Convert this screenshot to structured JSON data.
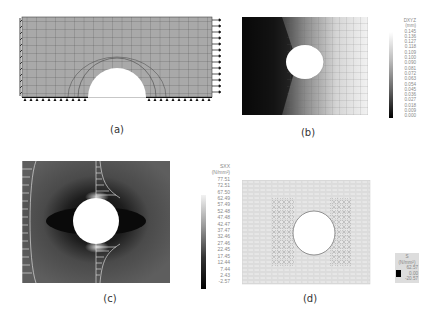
{
  "panels": [
    {
      "id": "a",
      "caption": "(a)",
      "description": "Finite element mesh of plate with semicircular hole; fixed supports on left and bottom edges, tensile load arrows on right edge"
    },
    {
      "id": "b",
      "caption": "(b)",
      "description": "Displacement contour DXYZ on deformed mesh"
    },
    {
      "id": "c",
      "caption": "(c)",
      "description": "Normal stress SXX contour with stress distribution profiles"
    },
    {
      "id": "d",
      "caption": "(d)",
      "description": "Principal stress vector plot"
    }
  ],
  "legend_b": {
    "title": "DXYZ",
    "unit": "(mm)",
    "values": [
      "0.145",
      "0.136",
      "0.127",
      "0.118",
      "0.109",
      "0.100",
      "0.090",
      "0.081",
      "0.072",
      "0.063",
      "0.054",
      "0.045",
      "0.036",
      "0.027",
      "0.018",
      "0.009",
      "0.000"
    ]
  },
  "legend_c": {
    "title": "SXX",
    "unit": "(N/mm²)",
    "values": [
      "77.51",
      "72.51",
      "67.50",
      "62.49",
      "57.49",
      "52.48",
      "47.48",
      "42.47",
      "37.47",
      "32.46",
      "27.46",
      "22.45",
      "17.45",
      "12.44",
      "7.44",
      "2.43",
      "-2.57"
    ]
  },
  "legend_d": {
    "title": "S",
    "unit": "(N/mm²)",
    "values": [
      "62.57",
      "0.00",
      "-20.57"
    ]
  }
}
